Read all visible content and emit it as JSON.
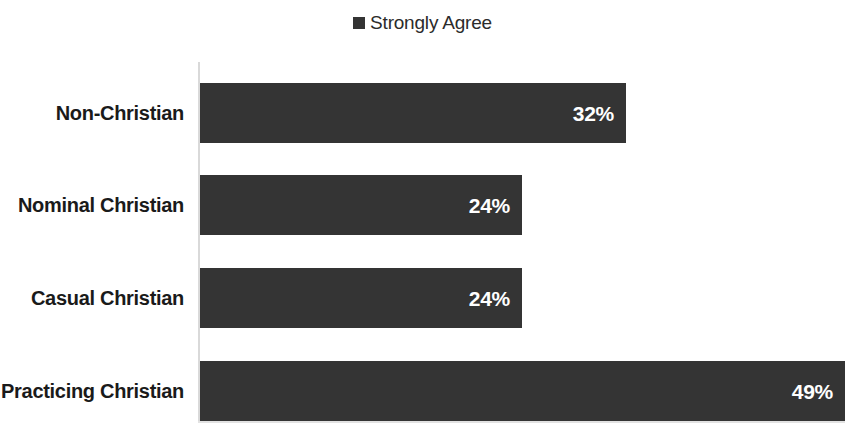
{
  "legend": {
    "position": "top-center",
    "entries": [
      {
        "label": "Strongly Agree",
        "color": "#343434",
        "marker": "square-marker"
      }
    ]
  },
  "colors": {
    "bar": "#343434",
    "bar_label": "#ffffff",
    "category_label": "#1a1a1a",
    "axis": "#d9d9d9",
    "background": "#ffffff"
  },
  "chart_data": {
    "type": "bar",
    "orientation": "horizontal",
    "title": "",
    "subtitle": "",
    "xlabel": "",
    "ylabel": "",
    "grid": false,
    "legend_position": "top-center",
    "xlim": [
      0,
      49
    ],
    "categories": [
      "Non-Christian",
      "Nominal Christian",
      "Casual Christian",
      "Practicing Christian"
    ],
    "series": [
      {
        "name": "Strongly Agree",
        "color": "#343434",
        "values": [
          32,
          24,
          24,
          49
        ],
        "value_labels": [
          "32%",
          "24%",
          "24%",
          "49%"
        ]
      }
    ],
    "tick_labels": {
      "x": [],
      "y": [
        "Non-Christian",
        "Nominal Christian",
        "Casual Christian",
        "Practicing Christian"
      ]
    },
    "annotations": []
  },
  "rows": [
    {
      "category": "Non-Christian",
      "value": 32,
      "value_label": "32%",
      "bar_width_px": 426,
      "top_px": 83
    },
    {
      "category": "Nominal Christian",
      "value": 24,
      "value_label": "24%",
      "bar_width_px": 322,
      "top_px": 175
    },
    {
      "category": "Casual Christian",
      "value": 24,
      "value_label": "24%",
      "bar_width_px": 322,
      "top_px": 268
    },
    {
      "category": "Practicing Christian",
      "value": 49,
      "value_label": "49%",
      "bar_width_px": 645,
      "top_px": 361
    }
  ]
}
